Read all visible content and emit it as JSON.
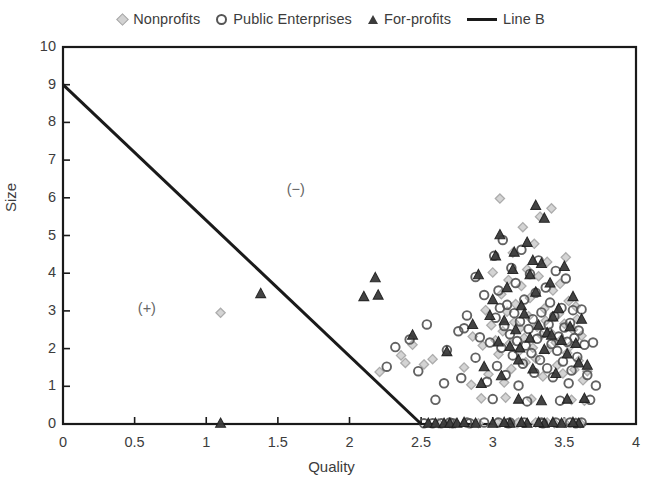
{
  "chart_data": {
    "type": "scatter",
    "title": "",
    "xlabel": "Quality",
    "ylabel": "Size",
    "xlim": [
      0,
      4
    ],
    "ylim": [
      0,
      10
    ],
    "xticks": [
      "0",
      "0.5",
      "1",
      "1.5",
      "2",
      "2.5",
      "3",
      "3.5",
      "4"
    ],
    "xtick_values": [
      0,
      0.5,
      1,
      1.5,
      2,
      2.5,
      3,
      3.5,
      4
    ],
    "yticks": [
      "0",
      "1",
      "2",
      "3",
      "4",
      "5",
      "6",
      "7",
      "8",
      "9",
      "10"
    ],
    "ytick_values": [
      0,
      1,
      2,
      3,
      4,
      5,
      6,
      7,
      8,
      9,
      10
    ],
    "grid": false,
    "legend_position": "top-center",
    "legend": [
      {
        "label": "Nonprofits",
        "marker": "diamond",
        "color": "#d2d2d2",
        "edge": "#a8a8a8"
      },
      {
        "label": "Public Enterprises",
        "marker": "circle",
        "color": "#ffffff",
        "edge": "#555555"
      },
      {
        "label": "For-profits",
        "marker": "triangle",
        "color": "#3b3b3b",
        "edge": "#2b2b2b"
      },
      {
        "label": "Line B",
        "marker": "line",
        "color": "#1a1a1a",
        "edge": "#1a1a1a"
      }
    ],
    "annotations": [
      {
        "text": "(−)",
        "x": 1.66,
        "y": 6.18
      },
      {
        "text": "(+)",
        "x": 0.62,
        "y": 3.02
      }
    ],
    "lines": [
      {
        "name": "Line B",
        "color": "#1a1a1a",
        "width": 3.0,
        "points": [
          [
            0,
            9
          ],
          [
            2.5,
            0
          ]
        ]
      }
    ],
    "series": [
      {
        "name": "Nonprofits",
        "marker": "diamond",
        "color": "#d2d2d2",
        "edge": "#a8a8a8",
        "points": [
          [
            1.1,
            2.95
          ],
          [
            2.21,
            1.38
          ],
          [
            2.36,
            1.82
          ],
          [
            2.39,
            1.62
          ],
          [
            2.44,
            2.1
          ],
          [
            2.52,
            1.58
          ],
          [
            2.58,
            1.72
          ],
          [
            2.62,
            0.02
          ],
          [
            2.7,
            0.02
          ],
          [
            2.74,
            0.02
          ],
          [
            2.8,
            1.5
          ],
          [
            2.86,
            2.32
          ],
          [
            2.9,
            0.02
          ],
          [
            2.93,
            2.08
          ],
          [
            2.95,
            3.02
          ],
          [
            2.97,
            1.32
          ],
          [
            2.99,
            2.62
          ],
          [
            3.0,
            4.02
          ],
          [
            3.02,
            2.22
          ],
          [
            3.04,
            1.85
          ],
          [
            3.05,
            5.98
          ],
          [
            3.06,
            3.44
          ],
          [
            3.07,
            2.46
          ],
          [
            3.08,
            1.1
          ],
          [
            3.09,
            0.7
          ],
          [
            3.1,
            2.98
          ],
          [
            3.11,
            3.82
          ],
          [
            3.12,
            2.14
          ],
          [
            3.13,
            1.46
          ],
          [
            3.14,
            4.54
          ],
          [
            3.15,
            2.7
          ],
          [
            3.16,
            3.18
          ],
          [
            3.17,
            0.02
          ],
          [
            3.18,
            1.92
          ],
          [
            3.19,
            2.54
          ],
          [
            3.2,
            3.66
          ],
          [
            3.21,
            5.22
          ],
          [
            3.22,
            2.28
          ],
          [
            3.23,
            1.64
          ],
          [
            3.24,
            4.1
          ],
          [
            3.25,
            2.86
          ],
          [
            3.26,
            3.34
          ],
          [
            3.27,
            0.66
          ],
          [
            3.28,
            2.02
          ],
          [
            3.29,
            4.78
          ],
          [
            3.3,
            1.74
          ],
          [
            3.31,
            2.58
          ],
          [
            3.32,
            3.92
          ],
          [
            3.33,
            5.5
          ],
          [
            3.34,
            2.36
          ],
          [
            3.35,
            1.26
          ],
          [
            3.36,
            3.06
          ],
          [
            3.37,
            2.74
          ],
          [
            3.38,
            4.3
          ],
          [
            3.39,
            1.98
          ],
          [
            3.4,
            2.44
          ],
          [
            3.41,
            5.72
          ],
          [
            3.42,
            3.54
          ],
          [
            3.43,
            0.02
          ],
          [
            3.44,
            2.16
          ],
          [
            3.45,
            1.56
          ],
          [
            3.46,
            2.92
          ],
          [
            3.47,
            3.72
          ],
          [
            3.48,
            2.24
          ],
          [
            3.49,
            1.34
          ],
          [
            3.5,
            2.66
          ],
          [
            3.51,
            4.42
          ],
          [
            3.52,
            1.88
          ],
          [
            3.53,
            3.26
          ],
          [
            3.54,
            2.06
          ],
          [
            3.55,
            0.64
          ],
          [
            3.56,
            2.5
          ],
          [
            3.57,
            1.44
          ],
          [
            3.58,
            3.12
          ],
          [
            3.59,
            2.78
          ],
          [
            3.6,
            1.68
          ],
          [
            3.61,
            0.02
          ],
          [
            3.62,
            2.34
          ],
          [
            3.63,
            1.16
          ],
          [
            3.64,
            0.62
          ],
          [
            3.66,
            1.4
          ],
          [
            2.85,
            1.04
          ],
          [
            2.92,
            0.68
          ],
          [
            3.03,
            0.04
          ],
          [
            3.18,
            0.04
          ],
          [
            3.3,
            0.04
          ],
          [
            3.38,
            0.04
          ],
          [
            3.5,
            0.04
          ],
          [
            3.58,
            0.04
          ]
        ]
      },
      {
        "name": "Public Enterprises",
        "marker": "circle",
        "color": "#ffffff",
        "edge": "#555555",
        "points": [
          [
            2.26,
            1.52
          ],
          [
            2.32,
            2.04
          ],
          [
            2.42,
            2.24
          ],
          [
            2.48,
            1.4
          ],
          [
            2.54,
            2.64
          ],
          [
            2.6,
            0.64
          ],
          [
            2.64,
            0.02
          ],
          [
            2.68,
            1.96
          ],
          [
            2.72,
            0.02
          ],
          [
            2.76,
            2.46
          ],
          [
            2.78,
            1.22
          ],
          [
            2.82,
            2.88
          ],
          [
            2.84,
            0.02
          ],
          [
            2.88,
            1.76
          ],
          [
            2.91,
            2.3
          ],
          [
            2.94,
            3.42
          ],
          [
            2.96,
            1.12
          ],
          [
            2.98,
            2.16
          ],
          [
            3.0,
            0.66
          ],
          [
            3.01,
            4.46
          ],
          [
            3.02,
            2.82
          ],
          [
            3.03,
            1.54
          ],
          [
            3.04,
            3.54
          ],
          [
            3.06,
            2.02
          ],
          [
            3.07,
            4.88
          ],
          [
            3.08,
            2.6
          ],
          [
            3.09,
            1.3
          ],
          [
            3.1,
            3.16
          ],
          [
            3.11,
            0.02
          ],
          [
            3.12,
            2.38
          ],
          [
            3.13,
            4.14
          ],
          [
            3.14,
            1.82
          ],
          [
            3.15,
            2.94
          ],
          [
            3.16,
            3.74
          ],
          [
            3.17,
            2.2
          ],
          [
            3.18,
            1.02
          ],
          [
            3.19,
            2.72
          ],
          [
            3.2,
            4.62
          ],
          [
            3.21,
            1.6
          ],
          [
            3.22,
            3.3
          ],
          [
            3.23,
            2.08
          ],
          [
            3.24,
            0.6
          ],
          [
            3.25,
            2.52
          ],
          [
            3.26,
            3.98
          ],
          [
            3.27,
            1.88
          ],
          [
            3.28,
            2.78
          ],
          [
            3.29,
            1.36
          ],
          [
            3.3,
            3.48
          ],
          [
            3.31,
            2.26
          ],
          [
            3.32,
            4.34
          ],
          [
            3.33,
            1.7
          ],
          [
            3.34,
            2.96
          ],
          [
            3.35,
            0.02
          ],
          [
            3.36,
            2.42
          ],
          [
            3.37,
            3.62
          ],
          [
            3.38,
            1.48
          ],
          [
            3.39,
            2.64
          ],
          [
            3.4,
            3.22
          ],
          [
            3.41,
            2.12
          ],
          [
            3.42,
            1.24
          ],
          [
            3.43,
            2.86
          ],
          [
            3.44,
            4.06
          ],
          [
            3.45,
            1.94
          ],
          [
            3.46,
            2.32
          ],
          [
            3.47,
            0.62
          ],
          [
            3.48,
            3.08
          ],
          [
            3.49,
            1.66
          ],
          [
            3.5,
            2.56
          ],
          [
            3.51,
            3.86
          ],
          [
            3.52,
            2.18
          ],
          [
            3.53,
            1.08
          ],
          [
            3.54,
            2.68
          ],
          [
            3.55,
            1.42
          ],
          [
            3.56,
            3.02
          ],
          [
            3.57,
            2.28
          ],
          [
            3.58,
            0.02
          ],
          [
            3.59,
            1.78
          ],
          [
            3.6,
            2.48
          ],
          [
            3.62,
            3.04
          ],
          [
            3.64,
            2.1
          ],
          [
            3.66,
            1.3
          ],
          [
            3.68,
            0.64
          ],
          [
            3.7,
            2.16
          ],
          [
            3.72,
            1.02
          ],
          [
            2.88,
            3.9
          ],
          [
            3.05,
            3.08
          ],
          [
            2.8,
            2.54
          ],
          [
            2.66,
            1.08
          ],
          [
            2.58,
            0.02
          ],
          [
            2.52,
            0.02
          ],
          [
            3.04,
            0.04
          ],
          [
            3.12,
            0.04
          ],
          [
            3.22,
            0.04
          ],
          [
            3.34,
            0.04
          ],
          [
            3.44,
            0.04
          ],
          [
            3.54,
            0.04
          ],
          [
            3.62,
            0.04
          ],
          [
            2.7,
            0.04
          ],
          [
            2.82,
            0.04
          ],
          [
            2.94,
            0.04
          ]
        ]
      },
      {
        "name": "For-profits",
        "marker": "triangle",
        "color": "#3b3b3b",
        "edge": "#2b2b2b",
        "points": [
          [
            1.38,
            3.46
          ],
          [
            2.1,
            3.38
          ],
          [
            2.18,
            3.88
          ],
          [
            2.2,
            3.42
          ],
          [
            1.1,
            0.02
          ],
          [
            2.55,
            0.02
          ],
          [
            2.6,
            0.02
          ],
          [
            2.66,
            0.02
          ],
          [
            2.7,
            0.02
          ],
          [
            2.75,
            0.02
          ],
          [
            2.44,
            2.36
          ],
          [
            2.68,
            1.92
          ],
          [
            2.86,
            2.64
          ],
          [
            2.9,
            3.96
          ],
          [
            2.94,
            1.52
          ],
          [
            2.98,
            2.88
          ],
          [
            3.0,
            3.3
          ],
          [
            3.02,
            4.46
          ],
          [
            3.04,
            2.18
          ],
          [
            3.06,
            1.28
          ],
          [
            3.08,
            2.74
          ],
          [
            3.1,
            3.62
          ],
          [
            3.12,
            2.06
          ],
          [
            3.14,
            4.1
          ],
          [
            3.16,
            2.5
          ],
          [
            3.18,
            1.7
          ],
          [
            3.2,
            3.14
          ],
          [
            3.22,
            2.92
          ],
          [
            3.24,
            4.82
          ],
          [
            3.26,
            2.28
          ],
          [
            3.28,
            1.46
          ],
          [
            3.3,
            3.5
          ],
          [
            3.32,
            2.62
          ],
          [
            3.34,
            4.26
          ],
          [
            3.36,
            1.98
          ],
          [
            3.38,
            2.42
          ],
          [
            3.4,
            3.74
          ],
          [
            3.42,
            2.84
          ],
          [
            3.44,
            1.34
          ],
          [
            3.46,
            3.06
          ],
          [
            3.48,
            2.22
          ],
          [
            3.5,
            4.18
          ],
          [
            3.52,
            1.86
          ],
          [
            3.54,
            2.58
          ],
          [
            3.56,
            3.38
          ],
          [
            3.58,
            2.14
          ],
          [
            3.6,
            1.62
          ],
          [
            3.62,
            2.78
          ],
          [
            3.64,
            0.68
          ],
          [
            3.66,
            1.56
          ],
          [
            3.05,
            5.02
          ],
          [
            3.3,
            5.8
          ],
          [
            3.36,
            5.46
          ],
          [
            3.12,
            0.02
          ],
          [
            3.24,
            0.02
          ],
          [
            3.36,
            0.02
          ],
          [
            3.48,
            0.02
          ],
          [
            3.6,
            0.02
          ],
          [
            2.88,
            0.02
          ],
          [
            3.0,
            0.02
          ],
          [
            3.18,
            0.66
          ],
          [
            3.34,
            0.62
          ],
          [
            3.52,
            0.66
          ],
          [
            2.92,
            1.08
          ],
          [
            3.08,
            0.04
          ],
          [
            3.2,
            0.04
          ],
          [
            3.32,
            0.04
          ],
          [
            3.42,
            0.04
          ],
          [
            3.56,
            0.04
          ],
          [
            2.8,
            0.04
          ],
          [
            3.26,
            3.96
          ],
          [
            3.28,
            4.34
          ],
          [
            3.15,
            4.56
          ],
          [
            3.19,
            2.02
          ],
          [
            3.41,
            2.36
          ]
        ]
      }
    ]
  },
  "plot_geometry": {
    "left": 63,
    "right": 636,
    "top": 47,
    "bottom": 424
  }
}
